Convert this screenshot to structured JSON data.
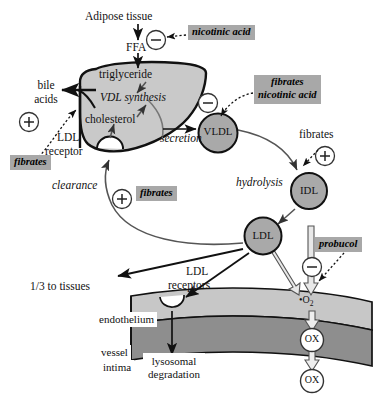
{
  "diagram": {
    "colors": {
      "liver_fill": "#c9c9c9",
      "particle_fill": "#a9a9a9",
      "drug_highlight": "#a8a8a8",
      "endothelium_fill": "#c7c7c7",
      "intima_fill": "#8e8e8e",
      "stroke": "#111111",
      "thin_stroke": "#4a4a4a",
      "white": "#ffffff"
    }
  },
  "labels": {
    "adipose_tissue": "Adipose tissue",
    "ffa": "FFA",
    "triglyceride": "triglyceride",
    "vdl_synthesis": "VDL synthesis",
    "cholesterol": "cholesterol",
    "bile_acids_line1": "bile",
    "bile_acids_line2": "acids",
    "ldl_receptor_line1": "LDL",
    "ldl_receptor_line2": "receptor",
    "secretion": "secretion",
    "clearance": "clearance",
    "hydrolysis": "hydrolysis",
    "vldl": "VLDL",
    "idl": "IDL",
    "ldl": "LDL",
    "ldl_receptors_line1": "LDL",
    "ldl_receptors_line2": "receptors",
    "one_third_to_tissues": "1/3 to tissues",
    "endothelium": "endothelium",
    "vessel_line1": "vessel",
    "vessel_line2": "intima",
    "lysosomal_line1": "lysosomal",
    "lysosomal_line2": "degradation",
    "superoxide": "•O",
    "superoxide_sub": "2",
    "ox_upper": "OX",
    "ox_lower": "OX"
  },
  "drugs": [
    {
      "id": "nicotinic-acid-adipose",
      "text": "nicotinic acid",
      "effect": "inhibit"
    },
    {
      "id": "fibrates-nicotinic-acid-secretion",
      "line1": "fibrates",
      "line2": "nicotinic acid",
      "effect": "inhibit"
    },
    {
      "id": "fibrates-bile-acids",
      "text": "fibrates",
      "effect": "stimulate"
    },
    {
      "id": "fibrates-clearance",
      "text": "fibrates",
      "effect": "stimulate"
    },
    {
      "id": "fibrates-hydrolysis",
      "text": "fibrates",
      "effect": "stimulate",
      "highlighted": false
    },
    {
      "id": "probucol",
      "text": "probucol",
      "effect": "inhibit"
    }
  ],
  "signs": {
    "plus": "+",
    "minus": "–"
  }
}
